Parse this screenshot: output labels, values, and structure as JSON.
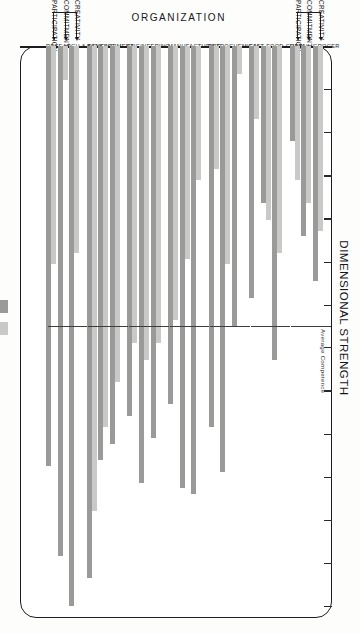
{
  "chart_data": {
    "type": "bar",
    "orientation": "horizontal",
    "title": "DIMENSIONAL STRENGTH",
    "xlabel": "DIMENSIONAL STRENGTH",
    "ylabel": "ORGANIZATION",
    "xlim": [
      0,
      100
    ],
    "grid": false,
    "reference_line": {
      "label": "Average Competence",
      "value": 50
    },
    "legend": {
      "position": "right",
      "entries": [
        {
          "name": "HIGH PERFORMING",
          "color": "#9a9a98"
        },
        {
          "name": "LOW PERFORMING",
          "color": "#c9c9c7"
        }
      ]
    },
    "dimensions": [
      "CREATIVITY",
      "COMMITMENT",
      "PARTICIPATION"
    ],
    "categories": [
      "RETAIL GROCER",
      "FAST FOOD CHAIN",
      "PETROCHEMICAL",
      "MANUFACTURING",
      "ENGINEERING",
      "BANKING",
      "RESEARCH & DEVELOPMENT"
    ],
    "series": [
      {
        "name": "LOW PERFORMING",
        "color": "#c9c9c7",
        "groups": [
          {
            "category": "RETAIL GROCER",
            "values": {
              "CREATIVITY": 33,
              "COMMITMENT": 28,
              "PARTICIPATION": 24
            }
          },
          {
            "category": "FAST FOOD CHAIN",
            "values": {
              "CREATIVITY": 37,
              "COMMITMENT": 31,
              "PARTICIPATION": 13
            }
          },
          {
            "category": "PETROCHEMICAL",
            "values": {
              "CREATIVITY": 5,
              "COMMITMENT": 39,
              "PARTICIPATION": 22
            }
          },
          {
            "category": "MANUFACTURING",
            "values": {
              "CREATIVITY": 24,
              "COMMITMENT": 38,
              "PARTICIPATION": 49
            }
          },
          {
            "category": "ENGINEERING",
            "values": {
              "CREATIVITY": 53,
              "COMMITMENT": 56,
              "PARTICIPATION": 53
            }
          },
          {
            "category": "BANKING",
            "values": {
              "CREATIVITY": 60,
              "COMMITMENT": 68,
              "PARTICIPATION": 83
            }
          },
          {
            "category": "RESEARCH & DEVELOPMENT",
            "values": {
              "CREATIVITY": 37,
              "COMMITMENT": 6,
              "PARTICIPATION": 39
            }
          }
        ]
      },
      {
        "name": "HIGH PERFORMING",
        "color": "#9a9a98",
        "groups": [
          {
            "category": "RETAIL GROCER",
            "values": {
              "CREATIVITY": 42,
              "COMMITMENT": 34,
              "PARTICIPATION": 17
            }
          },
          {
            "category": "FAST FOOD CHAIN",
            "values": {
              "CREATIVITY": 56,
              "COMMITMENT": 28,
              "PARTICIPATION": 45
            }
          },
          {
            "category": "PETROCHEMICAL",
            "values": {
              "CREATIVITY": 50,
              "COMMITMENT": 76,
              "PARTICIPATION": 68
            }
          },
          {
            "category": "MANUFACTURING",
            "values": {
              "CREATIVITY": 80,
              "COMMITMENT": 79,
              "PARTICIPATION": 64
            }
          },
          {
            "category": "ENGINEERING",
            "values": {
              "CREATIVITY": 70,
              "COMMITMENT": 78,
              "PARTICIPATION": 66
            }
          },
          {
            "category": "BANKING",
            "values": {
              "CREATIVITY": 71,
              "COMMITMENT": 74,
              "PARTICIPATION": 95
            }
          },
          {
            "category": "RESEARCH & DEVELOPMENT",
            "values": {
              "CREATIVITY": 100,
              "COMMITMENT": 91,
              "PARTICIPATION": 75
            }
          }
        ]
      }
    ],
    "ticks": [
      0,
      7.7,
      15.4,
      23.1,
      30.8,
      38.5,
      46.2,
      53.8,
      61.5,
      69.2,
      76.9,
      84.6,
      92.3,
      100
    ]
  }
}
